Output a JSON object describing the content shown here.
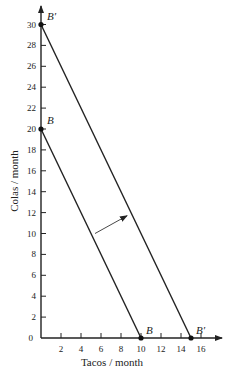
{
  "chart_data": {
    "type": "line",
    "title": "",
    "xlabel": "Tacos / month",
    "ylabel": "Colas / month",
    "xlim": [
      0,
      17
    ],
    "ylim": [
      0,
      31
    ],
    "x_ticks": [
      2,
      4,
      6,
      8,
      10,
      12,
      14,
      16
    ],
    "y_ticks": [
      0,
      2,
      4,
      6,
      8,
      10,
      12,
      14,
      16,
      18,
      20,
      22,
      24,
      26,
      28,
      30
    ],
    "grid": false,
    "series": [
      {
        "name": "B",
        "points": [
          [
            0,
            20
          ],
          [
            10,
            0
          ]
        ],
        "labels": [
          "B",
          "B"
        ]
      },
      {
        "name": "B'",
        "points": [
          [
            0,
            30
          ],
          [
            15,
            0
          ]
        ],
        "labels": [
          "B'",
          "B'"
        ]
      }
    ],
    "annotations": [
      {
        "type": "arrow",
        "from": [
          5.4,
          10
        ],
        "to": [
          8.6,
          11.7
        ],
        "description": "Budget line shifts outward from B to B'"
      }
    ]
  },
  "labels": {
    "origin": "0",
    "B": "B",
    "Bprime": "B′"
  }
}
